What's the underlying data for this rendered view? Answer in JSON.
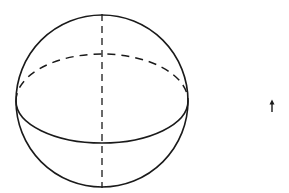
{
  "diagram": {
    "type": "sphere-with-equator",
    "stroke_color": "#1a1a1a",
    "background": "#ffffff",
    "sphere": {
      "cx": 102,
      "cy": 101,
      "r": 86
    },
    "equator": {
      "cx": 102,
      "cy": 101,
      "rx": 86,
      "ry": 42
    },
    "axis": {
      "x": 102,
      "y1": 14,
      "y2": 188,
      "style": "dashed"
    },
    "arrow": {
      "x": 272,
      "y_top": 101,
      "y_bottom": 112,
      "direction": "up",
      "icon": "up-arrow-icon"
    }
  }
}
